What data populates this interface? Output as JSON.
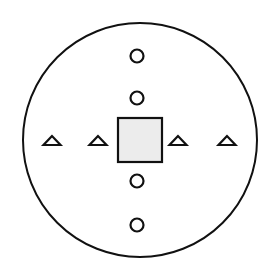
{
  "diagram": {
    "width": 273,
    "height": 277,
    "background": "#ffffff",
    "stroke_color": "#111111",
    "outer_circle": {
      "cx": 140,
      "cy": 140,
      "r": 117,
      "stroke_width": 2
    },
    "center_square": {
      "x": 118,
      "y": 118,
      "size": 44,
      "fill": "#ececec",
      "stroke_width": 2.2
    },
    "small_circles": [
      {
        "cx": 137,
        "cy": 56,
        "r": 6.5
      },
      {
        "cx": 137,
        "cy": 98,
        "r": 6.5
      },
      {
        "cx": 137,
        "cy": 181,
        "r": 6.5
      },
      {
        "cx": 137,
        "cy": 225,
        "r": 6.5
      }
    ],
    "triangles": [
      {
        "cx": 52,
        "base_y": 145,
        "half_width": 8.5,
        "height": 9
      },
      {
        "cx": 98,
        "base_y": 145,
        "half_width": 8.5,
        "height": 9
      },
      {
        "cx": 178,
        "base_y": 145,
        "half_width": 8.5,
        "height": 9
      },
      {
        "cx": 227,
        "base_y": 145,
        "half_width": 8.5,
        "height": 9
      }
    ],
    "shape_stroke_width": 2.2
  }
}
